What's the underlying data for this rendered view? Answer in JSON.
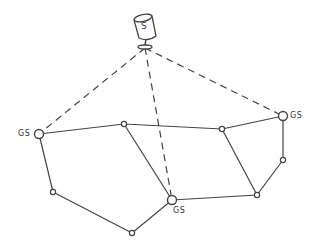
{
  "diagram": {
    "satellite": {
      "label": "S",
      "x": 145,
      "y": 28
    },
    "ground_stations": [
      {
        "id": "gs-left",
        "label": "GS",
        "x": 39,
        "y": 134,
        "label_x": 18,
        "label_y": 129
      },
      {
        "id": "gs-right",
        "label": "GS",
        "x": 283,
        "y": 116,
        "label_x": 290,
        "label_y": 111
      },
      {
        "id": "gs-bottom",
        "label": "GS",
        "x": 172,
        "y": 200,
        "label_x": 173,
        "label_y": 206
      }
    ],
    "nodes": [
      {
        "id": "n1",
        "x": 124,
        "y": 124
      },
      {
        "id": "n2",
        "x": 222,
        "y": 129
      },
      {
        "id": "n3",
        "x": 283,
        "y": 160
      },
      {
        "id": "n4",
        "x": 257,
        "y": 195
      },
      {
        "id": "n5",
        "x": 53,
        "y": 192
      },
      {
        "id": "n6",
        "x": 132,
        "y": 233
      }
    ],
    "links": [
      [
        "gs-left",
        "n1"
      ],
      [
        "n1",
        "n2"
      ],
      [
        "n2",
        "gs-right"
      ],
      [
        "gs-left",
        "n5"
      ],
      [
        "n5",
        "n6"
      ],
      [
        "n6",
        "gs-bottom"
      ],
      [
        "n1",
        "gs-bottom"
      ],
      [
        "gs-bottom",
        "n4"
      ],
      [
        "n2",
        "n4"
      ],
      [
        "gs-right",
        "n3"
      ],
      [
        "n3",
        "n4"
      ]
    ],
    "satellite_links": [
      "gs-left",
      "gs-right",
      "gs-bottom"
    ],
    "colors": {
      "line": "#444444",
      "background": "#ffffff"
    }
  }
}
